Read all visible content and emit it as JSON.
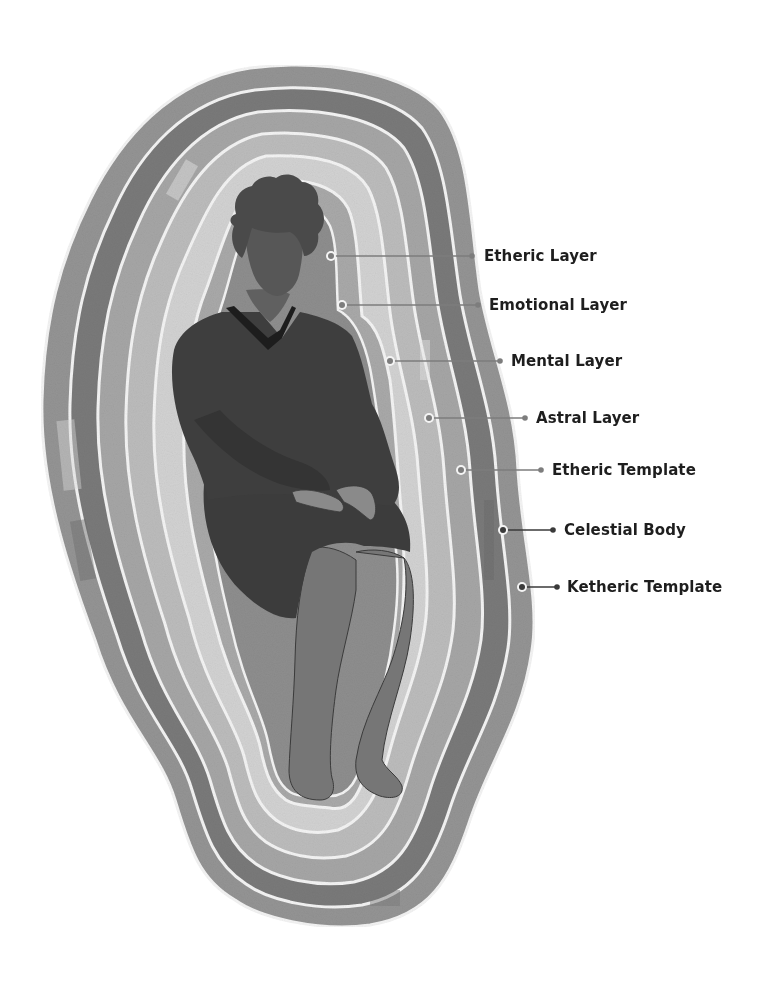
{
  "diagram": {
    "labels": [
      {
        "id": "etheric-layer",
        "text": "Etheric Layer",
        "dot": [
          331,
          256
        ],
        "end": [
          472,
          256
        ],
        "text_x": 484,
        "text_y": 247,
        "dark": false
      },
      {
        "id": "emotional-layer",
        "text": "Emotional Layer",
        "dot": [
          342,
          305
        ],
        "end": [
          478,
          305
        ],
        "text_x": 489,
        "text_y": 296,
        "dark": false
      },
      {
        "id": "mental-layer",
        "text": "Mental Layer",
        "dot": [
          390,
          361
        ],
        "end": [
          500,
          361
        ],
        "text_x": 511,
        "text_y": 352,
        "dark": false
      },
      {
        "id": "astral-layer",
        "text": "Astral Layer",
        "dot": [
          429,
          418
        ],
        "end": [
          525,
          418
        ],
        "text_x": 536,
        "text_y": 409,
        "dark": false
      },
      {
        "id": "etheric-template",
        "text": "Etheric Template",
        "dot": [
          461,
          470
        ],
        "end": [
          541,
          470
        ],
        "text_x": 552,
        "text_y": 461,
        "dark": false
      },
      {
        "id": "celestial-body",
        "text": "Celestial Body",
        "dot": [
          503,
          530
        ],
        "end": [
          553,
          530
        ],
        "text_x": 564,
        "text_y": 521,
        "dark": true
      },
      {
        "id": "ketheric-template",
        "text": "Ketheric Template",
        "dot": [
          522,
          587
        ],
        "end": [
          557,
          587
        ],
        "text_x": 567,
        "text_y": 578,
        "dark": true
      }
    ],
    "layer_fills": [
      "#8f8f8f",
      "#7c7c7c",
      "#a3a3a3",
      "#b8b8b8",
      "#c9c9c9",
      "#dddddd",
      "#b0b0b0",
      "#9c9c9c"
    ],
    "figure_colors": {
      "hair": "#4a4a4a",
      "skin": "#6a6a6a",
      "sweater": "#3b3b3b",
      "collar": "#1f1f1f",
      "legs": "#727272"
    }
  }
}
